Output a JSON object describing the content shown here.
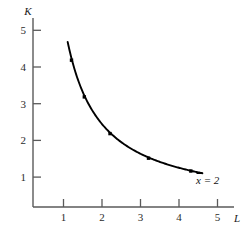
{
  "chart_data": {
    "type": "line",
    "title": "",
    "subtitle": "",
    "xlabel": "L",
    "ylabel": "K",
    "xlim": [
      0,
      5.6
    ],
    "ylim": [
      0,
      5.6
    ],
    "grid": false,
    "legend": null,
    "xticks": [
      "1",
      "2",
      "3",
      "4",
      "5"
    ],
    "xtick_values": [
      1,
      2,
      3,
      4,
      5
    ],
    "yticks": [
      "1",
      "2",
      "3",
      "4",
      "5"
    ],
    "ytick_values": [
      1,
      2,
      3,
      4,
      5
    ],
    "annotations": [
      {
        "text": "x = 2",
        "x": 4.35,
        "y": 0.95,
        "style": "italic",
        "attached_to": "curve-right-endpoint"
      }
    ],
    "series": [
      {
        "name": "isoquant x = 2",
        "relation": "L * K = 4",
        "color": "#000000",
        "line_width": 1.8,
        "marker": "square",
        "x": [
          0.9,
          1.0,
          1.1,
          1.333,
          1.6,
          2.0,
          2.5,
          3.0,
          3.5,
          4.1,
          4.4
        ],
        "y": [
          4.5,
          4.0,
          3.64,
          3.0,
          2.5,
          2.0,
          1.6,
          1.33,
          1.14,
          0.98,
          0.91
        ],
        "marker_points": [
          {
            "x": 1.0,
            "y": 4.0
          },
          {
            "x": 1.333,
            "y": 3.0
          },
          {
            "x": 2.0,
            "y": 2.0
          },
          {
            "x": 3.0,
            "y": 1.33
          },
          {
            "x": 4.1,
            "y": 0.98
          }
        ]
      }
    ]
  },
  "axes": {
    "y_axis_name": "K",
    "x_axis_name": "L"
  },
  "colors": {
    "curve": "#000000",
    "axis": "#5a5a5a",
    "background": "#ffffff",
    "text": "#1a1a1a"
  }
}
